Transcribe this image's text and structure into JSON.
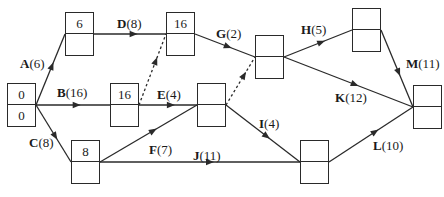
{
  "diagram": {
    "type": "activity-on-arrow network (precedence diagram)",
    "colors": {
      "line": "#2a2a2a",
      "background": "#ffffff"
    },
    "nodes": [
      {
        "id": "start",
        "x": 7,
        "y": 83,
        "top": "0",
        "bottom": "0"
      },
      {
        "id": "n_a",
        "x": 65,
        "y": 12,
        "top": "6",
        "bottom": ""
      },
      {
        "id": "n_b",
        "x": 110,
        "y": 83,
        "top": "16",
        "bottom": ""
      },
      {
        "id": "n_c",
        "x": 71,
        "y": 140,
        "top": "8",
        "bottom": ""
      },
      {
        "id": "n_d",
        "x": 166,
        "y": 12,
        "top": "16",
        "bottom": ""
      },
      {
        "id": "n_ef",
        "x": 197,
        "y": 83,
        "top": "",
        "bottom": ""
      },
      {
        "id": "n_g",
        "x": 255,
        "y": 35,
        "top": "",
        "bottom": ""
      },
      {
        "id": "n_h",
        "x": 352,
        "y": 8,
        "top": "",
        "bottom": ""
      },
      {
        "id": "n_ij",
        "x": 300,
        "y": 140,
        "top": "",
        "bottom": ""
      },
      {
        "id": "end",
        "x": 413,
        "y": 85,
        "top": "",
        "bottom": ""
      }
    ],
    "activities": [
      {
        "name": "A",
        "duration": "(6)",
        "from": "start",
        "to": "n_a",
        "dashed": false
      },
      {
        "name": "B",
        "duration": "(16)",
        "from": "start",
        "to": "n_b",
        "dashed": false
      },
      {
        "name": "C",
        "duration": "(8)",
        "from": "start",
        "to": "n_c",
        "dashed": false
      },
      {
        "name": "D",
        "duration": "(8)",
        "from": "n_a",
        "to": "n_d",
        "dashed": false
      },
      {
        "name": "E",
        "duration": "(4)",
        "from": "n_b",
        "to": "n_ef",
        "dashed": false
      },
      {
        "name": "F",
        "duration": "(7)",
        "from": "n_c",
        "to": "n_ef",
        "dashed": false
      },
      {
        "name": "G",
        "duration": "(2)",
        "from": "n_d",
        "to": "n_g",
        "dashed": false
      },
      {
        "name": "H",
        "duration": "(5)",
        "from": "n_g",
        "to": "n_h",
        "dashed": false
      },
      {
        "name": "I",
        "duration": "(4)",
        "from": "n_ef",
        "to": "n_ij",
        "dashed": false
      },
      {
        "name": "J",
        "duration": "(11)",
        "from": "n_c",
        "to": "n_ij",
        "dashed": false
      },
      {
        "name": "K",
        "duration": "(12)",
        "from": "n_g",
        "to": "end",
        "dashed": false
      },
      {
        "name": "L",
        "duration": "(10)",
        "from": "n_ij",
        "to": "end",
        "dashed": false
      },
      {
        "name": "M",
        "duration": "(11)",
        "from": "n_h",
        "to": "end",
        "dashed": false
      }
    ],
    "dummies": [
      {
        "from": "n_b",
        "to": "n_d",
        "dashed": true
      },
      {
        "from": "n_ef",
        "to": "n_g",
        "dashed": true
      }
    ],
    "labels": {
      "A": {
        "name": "A",
        "dur": "(6)",
        "x": 20,
        "y": 57
      },
      "B": {
        "name": "B",
        "dur": "(16)",
        "x": 57,
        "y": 86
      },
      "C": {
        "name": "C",
        "dur": "(8)",
        "x": 29,
        "y": 136
      },
      "D": {
        "name": "D",
        "dur": "(8)",
        "x": 117,
        "y": 17
      },
      "E": {
        "name": "E",
        "dur": "(4)",
        "x": 157,
        "y": 88
      },
      "F": {
        "name": "F",
        "dur": "(7)",
        "x": 149,
        "y": 143
      },
      "G": {
        "name": "G",
        "dur": "(2)",
        "x": 216,
        "y": 27
      },
      "H": {
        "name": "H",
        "dur": "(5)",
        "x": 301,
        "y": 23
      },
      "I": {
        "name": "I",
        "dur": "(4)",
        "x": 259,
        "y": 117
      },
      "J": {
        "name": "J",
        "dur": "(11)",
        "x": 193,
        "y": 149
      },
      "K": {
        "name": "K",
        "dur": "(12)",
        "x": 335,
        "y": 91
      },
      "L": {
        "name": "L",
        "dur": "(10)",
        "x": 373,
        "y": 139
      },
      "M": {
        "name": "M",
        "dur": "(11)",
        "x": 406,
        "y": 57
      }
    }
  }
}
